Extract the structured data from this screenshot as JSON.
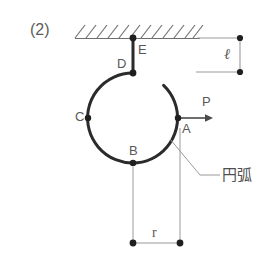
{
  "figure": {
    "problem_number": "(2)",
    "colors": {
      "arc_stroke": "#2b2b2b",
      "thin_line": "#8a8a8a",
      "hatch_line": "#707070",
      "text": "#585858",
      "node_dot": "#1f1f1f"
    },
    "point_labels": {
      "A": "A",
      "B": "B",
      "C": "C",
      "D": "D",
      "E": "E"
    },
    "force_label": "P",
    "length_label": "ℓ",
    "radius_label": "r",
    "arc_annotation": "円弧",
    "geometry": {
      "circle_center_x": 133,
      "circle_center_y": 118,
      "circle_radius": 45,
      "arc_gap_start_deg": 60,
      "support_line_y": 38,
      "support_line_x1": 75,
      "support_line_x2": 200,
      "node_E_x": 133,
      "node_E_y": 38,
      "node_D_x": 133,
      "node_D_y": 73,
      "node_A_x": 178,
      "node_A_y": 118,
      "node_B_x": 133,
      "node_B_y": 163,
      "node_C_x": 88,
      "node_C_y": 118,
      "force_arrow_x1": 178,
      "force_arrow_x2": 213,
      "force_arrow_y": 118,
      "dim_ell_x": 240,
      "dim_ell_y1": 38,
      "dim_ell_y2": 72,
      "dim_r_y": 243,
      "dim_r_x1": 133,
      "dim_r_x2": 180
    }
  }
}
